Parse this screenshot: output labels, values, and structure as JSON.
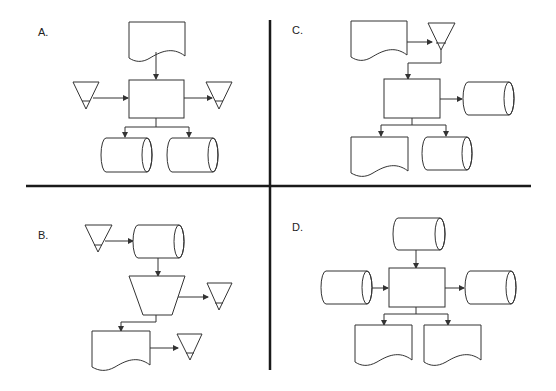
{
  "panels": [
    {
      "id": "A",
      "label": "A.",
      "shapes": [
        "document",
        "process-box",
        "merge-triangle-left",
        "merge-triangle-right",
        "disk-left",
        "disk-right"
      ]
    },
    {
      "id": "B",
      "label": "B.",
      "shapes": [
        "merge-triangle",
        "disk",
        "manual-operation-trapezoid",
        "merge-triangle-right",
        "document",
        "merge-triangle-bottom"
      ]
    },
    {
      "id": "C",
      "label": "C.",
      "shapes": [
        "document",
        "merge-triangle",
        "process-box",
        "disk-right",
        "document-bottom",
        "disk-bottom"
      ]
    },
    {
      "id": "D",
      "label": "D.",
      "shapes": [
        "disk-top",
        "disk-left",
        "process-box",
        "disk-right",
        "document-left",
        "document-right"
      ]
    }
  ],
  "colors": {
    "stroke": "#333333",
    "divider": "#1a1a1a",
    "background": "#ffffff"
  }
}
